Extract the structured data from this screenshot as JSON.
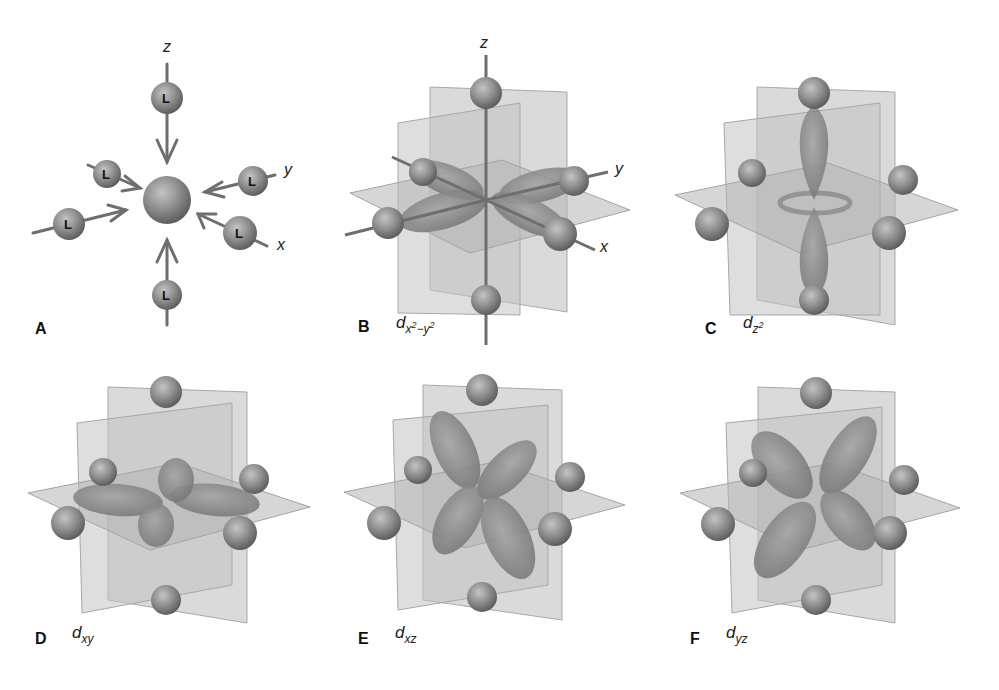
{
  "figure": {
    "colors": {
      "background": "#ffffff",
      "ligand_sphere": "#8a8a8a",
      "plane": "#b8b8b8",
      "lobe": "#8c8c8c",
      "axis": "#6e6e6e",
      "text": "#111111"
    },
    "panels": [
      {
        "id": "A",
        "label": "A",
        "orbital": "",
        "ligand_symbol": "L",
        "axes": {
          "z": "z",
          "y": "y",
          "x": "x"
        },
        "ligand_count": 6
      },
      {
        "id": "B",
        "label": "B",
        "orbital_base": "d",
        "orbital_sub": "x",
        "orbital_sup1": "2",
        "orbital_mid": "−y",
        "orbital_sup2": "2",
        "axes": {
          "z": "z",
          "y": "y",
          "x": "x"
        }
      },
      {
        "id": "C",
        "label": "C",
        "orbital_base": "d",
        "orbital_sub": "z",
        "orbital_sup": "2"
      },
      {
        "id": "D",
        "label": "D",
        "orbital_base": "d",
        "orbital_sub": "xy"
      },
      {
        "id": "E",
        "label": "E",
        "orbital_base": "d",
        "orbital_sub": "xz"
      },
      {
        "id": "F",
        "label": "F",
        "orbital_base": "d",
        "orbital_sub": "yz"
      }
    ]
  }
}
